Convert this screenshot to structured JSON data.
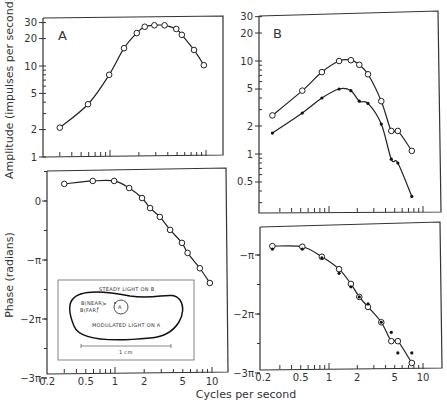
{
  "figure": {
    "xlabel": "Cycles per second",
    "ylabel_amplitude": "Amplitude (impulses per second)",
    "ylabel_phase": "Phase (radians)",
    "panel_A_label": "A",
    "panel_B_label": "B",
    "inset": {
      "steady_label": "STEADY LIGHT ON B",
      "modulated_label": "MODULATED LIGHT ON A",
      "near_label": "B(NEAR)",
      "far_label": "B(FAR)",
      "spot_label": "A",
      "scale_label": "1 cm"
    },
    "x_tick_labels": [
      "0.2",
      "0.5",
      "1",
      "2",
      "5",
      "10"
    ]
  },
  "chart_data": [
    {
      "type": "line",
      "panel": "A-amplitude",
      "title": "A",
      "xlabel": "Cycles per second",
      "ylabel": "Amplitude (impulses per second)",
      "xscale": "log",
      "yscale": "log",
      "xlim": [
        0.2,
        12
      ],
      "ylim": [
        1,
        30
      ],
      "yticks": [
        1,
        2,
        5,
        10,
        20,
        30
      ],
      "ytick_labels": [
        "1",
        "2",
        "5",
        "10",
        "20",
        "30"
      ],
      "series": [
        {
          "name": "open circles",
          "marker": "open-circle",
          "x": [
            0.3,
            0.59,
            0.98,
            1.4,
            1.9,
            2.3,
            2.9,
            3.7,
            4.9,
            5.6,
            7.5,
            9.5
          ],
          "y": [
            2.1,
            3.8,
            8.0,
            15.7,
            23,
            27,
            28,
            28,
            25.5,
            22,
            15,
            10.2
          ]
        }
      ]
    },
    {
      "type": "line",
      "panel": "A-phase",
      "xlabel": "Cycles per second",
      "ylabel": "Phase (radians)",
      "xscale": "log",
      "xlim": [
        0.2,
        12
      ],
      "ylim_pi_units": [
        -3,
        0.45
      ],
      "yticks_pi_units": [
        0,
        -1,
        -2,
        -3
      ],
      "ytick_labels": [
        "0",
        "−π",
        "−2π",
        "−3π"
      ],
      "series": [
        {
          "name": "open circles",
          "marker": "open-circle",
          "x": [
            0.3,
            0.59,
            0.98,
            1.4,
            1.9,
            2.3,
            2.9,
            3.7,
            4.9,
            5.6,
            7.5,
            9.5
          ],
          "y_pi_units": [
            0.29,
            0.34,
            0.34,
            0.22,
            0.05,
            -0.12,
            -0.27,
            -0.49,
            -0.71,
            -0.88,
            -1.14,
            -1.39
          ]
        }
      ]
    },
    {
      "type": "line",
      "panel": "B-amplitude",
      "title": "B",
      "xlabel": "Cycles per second",
      "ylabel": "Amplitude (impulses per second)",
      "xscale": "log",
      "yscale": "log",
      "xlim": [
        0.2,
        14
      ],
      "ylim": [
        0.3,
        30
      ],
      "yticks": [
        0.5,
        1,
        2,
        5,
        10,
        20,
        30
      ],
      "ytick_labels": [
        "0.5",
        "1",
        "2",
        "5",
        "10",
        "20",
        "30"
      ],
      "series": [
        {
          "name": "B(near) open circles",
          "marker": "open-circle",
          "x": [
            0.25,
            0.52,
            0.84,
            1.28,
            1.71,
            2.1,
            2.6,
            3.6,
            4.6,
            5.4,
            7.6
          ],
          "y": [
            2.6,
            4.8,
            7.6,
            10,
            10.2,
            9.1,
            7.2,
            3.7,
            1.77,
            1.77,
            1.08
          ]
        },
        {
          "name": "B(far) filled dots",
          "marker": "dot",
          "x": [
            0.25,
            0.52,
            0.84,
            1.28,
            1.71,
            2.1,
            2.6,
            3.6,
            4.6,
            5.4,
            7.6
          ],
          "y": [
            1.68,
            2.76,
            4.0,
            5.0,
            4.8,
            3.7,
            3.5,
            2.1,
            0.88,
            0.8,
            0.35
          ]
        }
      ]
    },
    {
      "type": "line",
      "panel": "B-phase",
      "xlabel": "Cycles per second",
      "ylabel": "Phase (radians)",
      "xscale": "log",
      "xlim": [
        0.2,
        14
      ],
      "ylim_pi_units": [
        -3,
        -0.5
      ],
      "yticks_pi_units": [
        -1,
        -2,
        -3
      ],
      "ytick_labels": [
        "−π",
        "−2π",
        "−3π"
      ],
      "series": [
        {
          "name": "B(near) open circles",
          "marker": "open-circle",
          "x": [
            0.25,
            0.52,
            0.84,
            1.28,
            1.71,
            2.1,
            2.6,
            3.6,
            4.6,
            5.4,
            7.6
          ],
          "y_pi_units": [
            -0.85,
            -0.86,
            -1.03,
            -1.24,
            -1.49,
            -1.71,
            -1.88,
            -2.14,
            -2.46,
            -2.46,
            -2.83
          ]
        },
        {
          "name": "B(far) filled dots",
          "marker": "dot",
          "x": [
            0.25,
            0.52,
            0.84,
            1.28,
            1.71,
            2.1,
            2.6,
            3.6,
            4.6,
            5.4,
            7.6
          ],
          "y_pi_units": [
            -0.9,
            -0.9,
            -1.05,
            -1.31,
            -1.54,
            -1.71,
            -1.83,
            -2.14,
            -2.31,
            -2.66,
            -2.66
          ]
        }
      ]
    }
  ]
}
